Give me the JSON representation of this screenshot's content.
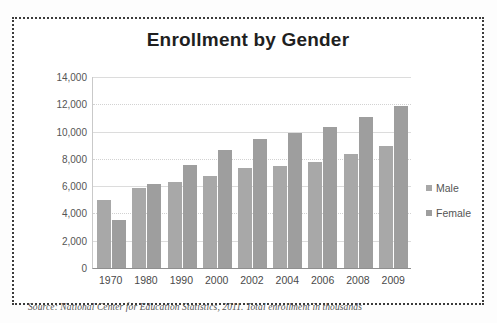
{
  "chart_data": {
    "type": "bar",
    "title": "Enrollment by Gender",
    "xlabel": "",
    "ylabel": "",
    "ylim": [
      0,
      14000
    ],
    "ytick_labels": [
      "14,000",
      "12,000",
      "10,000",
      "8,000",
      "6,000",
      "4,000",
      "2,000",
      "0"
    ],
    "ytick_values": [
      14000,
      12000,
      10000,
      8000,
      6000,
      4000,
      2000,
      0
    ],
    "grid": true,
    "legend_position": "right",
    "categories": [
      "1970",
      "1980",
      "1990",
      "2000",
      "2002",
      "2004",
      "2006",
      "2008",
      "2009"
    ],
    "series": [
      {
        "name": "Male",
        "color": "#a8a8a8",
        "values": [
          5000,
          5850,
          6300,
          6750,
          7300,
          7450,
          7800,
          8350,
          8950
        ]
      },
      {
        "name": "Female",
        "color": "#9e9e9e",
        "values": [
          3550,
          6150,
          7550,
          8650,
          9450,
          9900,
          10350,
          11050,
          11850
        ]
      }
    ],
    "annotations": [
      "Source: National Center for Education Statistics, 2011. Total enrollment in thousands"
    ]
  },
  "source_note": "Source: National Center for Education Statistics, 2011. Total enrollment in thousands"
}
